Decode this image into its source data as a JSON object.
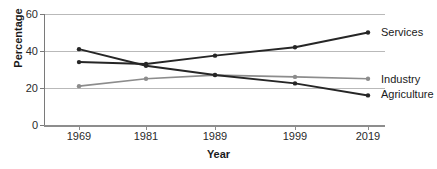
{
  "chart_data": {
    "type": "line",
    "title": "",
    "xlabel": "Year",
    "ylabel": "Percentage",
    "categories": [
      "1969",
      "1981",
      "1989",
      "1999",
      "2019"
    ],
    "ylim": [
      0,
      60
    ],
    "yticks": [
      0,
      20,
      40,
      60
    ],
    "ytick_labels": [
      "0",
      "20",
      "40",
      "60"
    ],
    "grid": "horizontal",
    "legend_position": "right-inline-labels",
    "series": [
      {
        "name": "Services",
        "color": "#262626",
        "values": [
          34,
          33,
          37.5,
          42,
          50
        ]
      },
      {
        "name": "Industry",
        "color": "#8c8c8c",
        "values": [
          21,
          25,
          27,
          26,
          25
        ]
      },
      {
        "name": "Agriculture",
        "color": "#262626",
        "values": [
          41,
          32,
          27,
          22.5,
          16
        ]
      }
    ]
  },
  "axes": {
    "y_title": "Percentage",
    "x_title": "Year"
  }
}
